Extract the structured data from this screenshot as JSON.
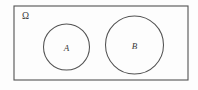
{
  "figure": {
    "kind": "venn-diagram",
    "canvas": {
      "width": 198,
      "height": 90,
      "background": "#fdfdfd"
    },
    "stroke_color": "#525252",
    "text_color": "#3b3b3b"
  },
  "universe": {
    "label": "Ω",
    "label_name": "omega-symbol",
    "shape": "rectangle",
    "x": 14,
    "y": 6,
    "width": 174,
    "height": 74,
    "label_x": 22,
    "label_y": 19
  },
  "sets": [
    {
      "label": "A",
      "shape": "circle",
      "cx": 66.5,
      "cy": 47,
      "r": 23,
      "label_x": 66.5,
      "label_y": 50.5
    },
    {
      "label": "B",
      "shape": "circle",
      "cx": 134.5,
      "cy": 45,
      "r": 29,
      "label_x": 134.5,
      "label_y": 48.5
    }
  ]
}
